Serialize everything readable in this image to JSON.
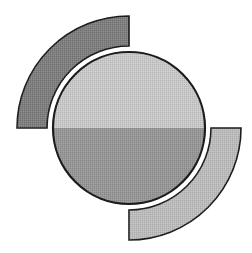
{
  "document": {
    "title": "Abstract Circle Logo",
    "background_color": "#ffffff",
    "width": 252,
    "height": 253,
    "description": "Abstract geometric emblem: a two-tone split circle flanked by two quarter-ring arcs"
  },
  "palette": {
    "background": "#ffffff",
    "outline": "#1c1c1c",
    "circle_upper_fill": "#c9c9c9",
    "circle_lower_fill": "#969696",
    "dark_arc_fill": "#7e7e7e",
    "light_arc_fill": "#bdbdbd",
    "halftone_dot": "#5a5a5a"
  },
  "geometry": {
    "center_x": 129,
    "center_y": 128,
    "circle_radius": 76,
    "circle_outline_width": 2.2,
    "white_gap_radius": 80,
    "arc_inner_radius": 82,
    "arc_outer_radius": 112,
    "arc_outline_width": 1.6,
    "split_line_y": 128
  },
  "shapes": [
    {
      "id": "dark-arc",
      "name": "dark-quarter-ring-upper-left",
      "fill": "#7e7e7e",
      "start_angle_deg": 180,
      "end_angle_deg": 270,
      "inner_radius": 82,
      "outer_radius": 112,
      "quadrant": "upper-left"
    },
    {
      "id": "light-arc",
      "name": "light-quarter-ring-lower-right",
      "fill": "#bdbdbd",
      "start_angle_deg": 0,
      "end_angle_deg": 90,
      "inner_radius": 82,
      "outer_radius": 112,
      "quadrant": "lower-right"
    },
    {
      "id": "circle-upper",
      "name": "circle-upper-half",
      "fill": "#c9c9c9",
      "radius": 76
    },
    {
      "id": "circle-lower",
      "name": "circle-lower-half",
      "fill": "#969696",
      "radius": 76
    }
  ],
  "labels": {
    "alt_text": "Abstract logo consisting of a circle split into a light upper half and a darker lower half, with a dark gray arc in the upper left and a light gray arc in the lower right"
  }
}
